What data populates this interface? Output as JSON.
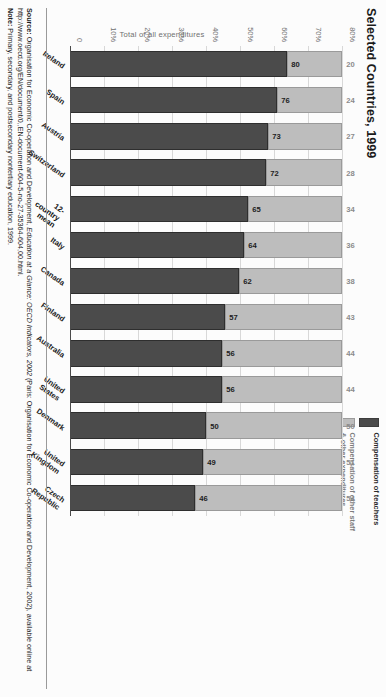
{
  "title": "Selected Countries, 1999",
  "legend": {
    "items": [
      {
        "label": "Compensation of teachers",
        "color": "#4b4b4b",
        "key": "teachers"
      },
      {
        "label": "Compensation of other staff\n& other expenditures",
        "color": "#bdbdbd",
        "key": "other"
      }
    ]
  },
  "axis": {
    "ylabel": "Total of all expenditures",
    "yticks": [
      "0",
      "10%",
      "20%",
      "30%",
      "40%",
      "50%",
      "60%",
      "70%",
      "80%"
    ]
  },
  "source": {
    "source_label": "Source:",
    "source_text": " Organisation for Economic Co-operation and Development, ",
    "source_italic": "Education at a Glance: OECD Indicators, 2002",
    "source_text2": " (Paris: Organisation for Economic Co-operation and Development, 2002), available online at http://www.oecd.org/EN/document/0,,EN-document-604-5-no-27-35364-604,00.html.",
    "note_label": "Note:",
    "note_text": " Primary, secondary, and postsecondary nontertiary education, 1999."
  },
  "chart_data": {
    "type": "bar",
    "subtype": "stacked-bar-100-percent",
    "title": "Selected Countries, 1999",
    "xlabel": "",
    "ylabel": "Total of all expenditures",
    "ylim": [
      0,
      80
    ],
    "yticks": [
      0,
      10,
      20,
      30,
      40,
      50,
      60,
      70,
      80
    ],
    "ytick_labels": [
      "0",
      "10%",
      "20%",
      "30%",
      "40%",
      "50%",
      "60%",
      "70%",
      "80%"
    ],
    "grid": true,
    "legend_position": "top-right",
    "categories": [
      "Ireland",
      "Spain",
      "Austria",
      "Switzerland",
      "12-country\nmean",
      "Italy",
      "Canada",
      "Finland",
      "Australia",
      "United\nStates",
      "Denmark",
      "United\nKingdom",
      "Czech\nRepublic"
    ],
    "series": [
      {
        "name": "Compensation of teachers",
        "color": "#4b4b4b",
        "values": [
          80,
          76,
          73,
          72,
          65,
          64,
          62,
          57,
          56,
          56,
          50,
          49,
          46
        ]
      },
      {
        "name": "Compensation of other staff & other expenditures",
        "color": "#bdbdbd",
        "values": [
          20,
          24,
          27,
          28,
          34,
          36,
          38,
          43,
          44,
          44,
          50,
          51,
          54
        ]
      }
    ]
  }
}
